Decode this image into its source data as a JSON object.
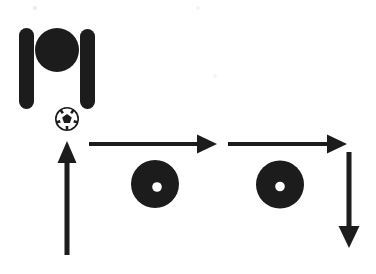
{
  "canvas": {
    "width": "376",
    "height": "274"
  },
  "colors": {
    "ink": "#1b1b1b",
    "paper": "#ffffff",
    "noise": "#ededed"
  },
  "figure": {
    "robot": {
      "name": "robot-top-view",
      "parts": [
        "left-wheel-bar",
        "body-circle",
        "right-wheel-bar"
      ]
    },
    "ball": {
      "name": "soccer-ball"
    },
    "path_arrows": [
      {
        "name": "up-arrow",
        "direction": "up"
      },
      {
        "name": "right-arrow-first",
        "direction": "right"
      },
      {
        "name": "right-arrow-second",
        "direction": "right"
      },
      {
        "name": "down-arrow",
        "direction": "down"
      }
    ],
    "discs": [
      {
        "name": "wheel-disc-left"
      },
      {
        "name": "wheel-disc-right"
      }
    ]
  }
}
